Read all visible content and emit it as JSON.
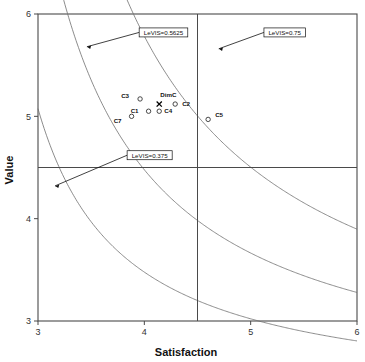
{
  "chart_data": {
    "type": "scatter",
    "title": "",
    "xlabel": "Satisfaction",
    "ylabel": "Value",
    "xlim": [
      3,
      6
    ],
    "ylim": [
      3,
      6
    ],
    "xticks": [
      "3",
      "4",
      "5",
      "6"
    ],
    "yticks": [
      "3",
      "4",
      "5",
      "6"
    ],
    "grid": false,
    "legend": "none",
    "points": [
      {
        "label": "C3",
        "x": 3.96,
        "y": 5.17,
        "marker": "open-circle",
        "label_dx": -11,
        "label_dy": -1
      },
      {
        "label": "DimC",
        "x": 4.14,
        "y": 5.12,
        "marker": "x",
        "label_dx": 1,
        "label_dy": -7
      },
      {
        "label": "C2",
        "x": 4.29,
        "y": 5.12,
        "marker": "open-circle",
        "label_dx": 7,
        "label_dy": 2
      },
      {
        "label": "C1",
        "x": 4.04,
        "y": 5.05,
        "marker": "open-circle",
        "label_dx": -10,
        "label_dy": 2
      },
      {
        "label": "C4",
        "x": 4.14,
        "y": 5.05,
        "marker": "open-circle",
        "label_dx": 5,
        "label_dy": 2
      },
      {
        "label": "C7",
        "x": 3.88,
        "y": 5.0,
        "marker": "open-circle",
        "label_dx": -10,
        "label_dy": 7
      },
      {
        "label": "C5",
        "x": 4.6,
        "y": 4.97,
        "marker": "open-circle",
        "label_dx": 7,
        "label_dy": -2
      }
    ],
    "reference_lines": [
      {
        "orientation": "vertical",
        "value": 4.5
      },
      {
        "orientation": "horizontal",
        "value": 4.5
      }
    ],
    "curves": [
      {
        "name": "LeVIS=0.375",
        "level": 0.375,
        "annotation": {
          "text": "LeVIS=0.375",
          "box_x": 4.05,
          "box_y": 4.62,
          "arrow_x": 3.16,
          "arrow_y": 4.32
        }
      },
      {
        "name": "LeVIS=0.5625",
        "level": 0.5625,
        "annotation": {
          "text": "LeVIS=0.5625",
          "box_x": 4.18,
          "box_y": 5.82,
          "arrow_x": 3.46,
          "arrow_y": 5.68
        }
      },
      {
        "name": "LeVIS=0.75",
        "level": 0.75,
        "annotation": {
          "text": "LeVIS=0.75",
          "box_x": 5.32,
          "box_y": 5.82,
          "arrow_x": 4.7,
          "arrow_y": 5.66
        }
      }
    ]
  },
  "axes": {
    "x_title": "Satisfaction",
    "y_title": "Value"
  }
}
